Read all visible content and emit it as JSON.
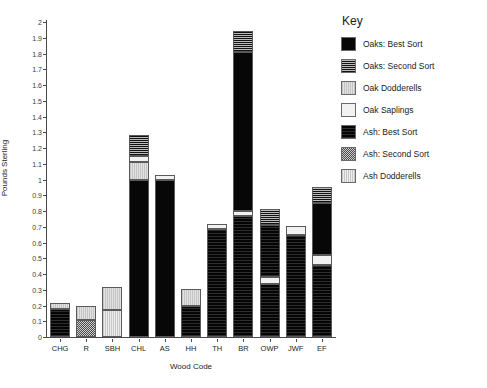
{
  "chart_data": {
    "type": "bar",
    "title": "",
    "xlabel": "Wood Code",
    "ylabel": "Pounds Sterling",
    "ylim": [
      0,
      2
    ],
    "ytick_step": 0.1,
    "yticks": [
      "2",
      "1.9",
      "1.8",
      "1.7",
      "1.6",
      "1.5",
      "1.4",
      "1.3",
      "1.2",
      "1.1",
      "1",
      "0.9",
      "0.8",
      "0.7",
      "0.6",
      "0.5",
      "0.4",
      "0.3",
      "0.2",
      "0.1",
      "0"
    ],
    "grid": false,
    "stacked": true,
    "legend_position": "right",
    "legend_title": "Key",
    "categories": [
      "CHG",
      "R",
      "SBH",
      "CHL",
      "AS",
      "HH",
      "TH",
      "BR",
      "OWP",
      "JWF",
      "EF"
    ],
    "series": [
      {
        "name": "Oaks: Best Sort",
        "pattern": "solid-black",
        "color": "#070707",
        "values": [
          0,
          0,
          0,
          1.0,
          1.0,
          0,
          0,
          0,
          0,
          0,
          0
        ]
      },
      {
        "name": "Oaks: Second Sort",
        "pattern": "horizontal-lines",
        "color": "#9a9a9a",
        "values": [
          0,
          0,
          0,
          0.13,
          0,
          0,
          0,
          0.13,
          0.105,
          0,
          0.105
        ]
      },
      {
        "name": "Oak Dodderells",
        "pattern": "vertical-light",
        "color": "#d2d2d2",
        "values": [
          0.035,
          0.095,
          0.15,
          0.11,
          0,
          0.105,
          0,
          0,
          0,
          0,
          0
        ]
      },
      {
        "name": "Oak Saplings",
        "pattern": "white-dotted",
        "color": "#f2f2f2",
        "values": [
          0,
          0,
          0,
          0.04,
          0.03,
          0,
          0.03,
          0.03,
          0.045,
          0.06,
          0.06
        ]
      },
      {
        "name": "Ash: Best Sort",
        "pattern": "dark-crosshatch",
        "color": "#0a0a0a",
        "values": [
          0.18,
          0,
          0,
          0,
          0,
          0.2,
          0.685,
          0.77,
          0.665,
          0.645,
          0.79
        ]
      },
      {
        "name": "Ash: Second Sort",
        "pattern": "checkerboard",
        "color": "#8e8e8e",
        "values": [
          0,
          0.105,
          0,
          0,
          0,
          0,
          0,
          0,
          0,
          0,
          0
        ]
      },
      {
        "name": "Ash Dodderells",
        "pattern": "vertical-pale",
        "color": "#dcdcdc",
        "values": [
          0,
          0,
          0.17,
          0,
          0,
          0,
          0,
          0,
          0,
          0,
          0
        ]
      }
    ],
    "bars": [
      {
        "category": "CHG",
        "total": 0.215,
        "segments": [
          {
            "series": "Ash: Best Sort",
            "from": 0,
            "to": 0.18
          },
          {
            "series": "Oak Dodderells",
            "from": 0.18,
            "to": 0.215
          }
        ]
      },
      {
        "category": "R",
        "total": 0.2,
        "segments": [
          {
            "series": "Ash: Second Sort",
            "from": 0,
            "to": 0.105
          },
          {
            "series": "Oak Dodderells",
            "from": 0.105,
            "to": 0.2
          }
        ]
      },
      {
        "category": "SBH",
        "total": 0.32,
        "segments": [
          {
            "series": "Ash Dodderells",
            "from": 0,
            "to": 0.17
          },
          {
            "series": "Oak Dodderells",
            "from": 0.17,
            "to": 0.32
          }
        ]
      },
      {
        "category": "CHL",
        "total": 1.28,
        "segments": [
          {
            "series": "Oaks: Best Sort",
            "from": 0,
            "to": 1.0
          },
          {
            "series": "Oak Dodderells",
            "from": 1.0,
            "to": 1.11
          },
          {
            "series": "Oak Saplings",
            "from": 1.11,
            "to": 1.15
          },
          {
            "series": "Oaks: Second Sort",
            "from": 1.15,
            "to": 1.28
          }
        ]
      },
      {
        "category": "AS",
        "total": 1.03,
        "segments": [
          {
            "series": "Oaks: Best Sort",
            "from": 0,
            "to": 1.0
          },
          {
            "series": "Oak Saplings",
            "from": 1.0,
            "to": 1.03
          }
        ]
      },
      {
        "category": "HH",
        "total": 0.305,
        "segments": [
          {
            "series": "Ash: Best Sort",
            "from": 0,
            "to": 0.2
          },
          {
            "series": "Oak Dodderells",
            "from": 0.2,
            "to": 0.305
          }
        ]
      },
      {
        "category": "TH",
        "total": 0.715,
        "segments": [
          {
            "series": "Ash: Best Sort",
            "from": 0,
            "to": 0.685
          },
          {
            "series": "Oak Saplings",
            "from": 0.685,
            "to": 0.715
          }
        ]
      },
      {
        "category": "BR",
        "total": 1.94,
        "segments": [
          {
            "series": "Ash: Best Sort",
            "from": 0,
            "to": 0.77
          },
          {
            "series": "Oak Saplings",
            "from": 0.77,
            "to": 0.8
          },
          {
            "series": "Oaks: Best Sort",
            "from": 0.8,
            "to": 1.81
          },
          {
            "series": "Oaks: Second Sort",
            "from": 1.81,
            "to": 1.94
          }
        ]
      },
      {
        "category": "OWP",
        "total": 0.815,
        "segments": [
          {
            "series": "Ash: Best Sort",
            "from": 0,
            "to": 0.335
          },
          {
            "series": "Oak Saplings",
            "from": 0.335,
            "to": 0.38
          },
          {
            "series": "Ash: Best Sort",
            "from": 0.38,
            "to": 0.71
          },
          {
            "series": "Oaks: Second Sort",
            "from": 0.71,
            "to": 0.815
          }
        ]
      },
      {
        "category": "JWF",
        "total": 0.705,
        "segments": [
          {
            "series": "Ash: Best Sort",
            "from": 0,
            "to": 0.645
          },
          {
            "series": "Oak Saplings",
            "from": 0.645,
            "to": 0.705
          }
        ]
      },
      {
        "category": "EF",
        "total": 0.955,
        "segments": [
          {
            "series": "Ash: Best Sort",
            "from": 0,
            "to": 0.46
          },
          {
            "series": "Oak Saplings",
            "from": 0.46,
            "to": 0.52
          },
          {
            "series": "Oaks: Best Sort",
            "from": 0.52,
            "to": 0.85
          },
          {
            "series": "Oaks: Second Sort",
            "from": 0.85,
            "to": 0.955
          }
        ]
      }
    ]
  },
  "legend": {
    "title": "Key",
    "items": [
      {
        "label": "Oaks: Best Sort",
        "pattern": "p-oaks-best"
      },
      {
        "label": "Oaks: Second Sort",
        "pattern": "p-oaks-second"
      },
      {
        "label": "Oak Dodderells",
        "pattern": "p-oak-dodd"
      },
      {
        "label": "Oak Saplings",
        "pattern": "p-oak-sap"
      },
      {
        "label": "Ash: Best Sort",
        "pattern": "p-ash-best"
      },
      {
        "label": "Ash: Second Sort",
        "pattern": "p-ash-second"
      },
      {
        "label": "Ash Dodderells",
        "pattern": "p-ash-dodd"
      }
    ]
  }
}
